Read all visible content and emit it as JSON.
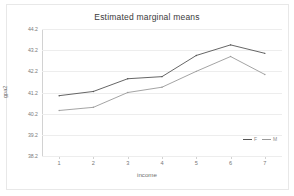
{
  "chart_data": {
    "type": "line",
    "title": "Estimated marginal means",
    "xlabel": "income",
    "ylabel": "gpa2",
    "categories": [
      "1",
      "2",
      "3",
      "4",
      "5",
      "6",
      "7"
    ],
    "x": [
      1,
      2,
      3,
      4,
      5,
      6,
      7
    ],
    "ytick_labels": [
      "44.2",
      "43.2",
      "42.2",
      "41.2",
      "40.2",
      "39.2",
      "38.2"
    ],
    "ytick_values": [
      44.2,
      43.2,
      42.2,
      41.2,
      40.2,
      39.2,
      38.2
    ],
    "ylim": [
      38.2,
      44.2
    ],
    "grid": true,
    "legend_position": "bottom-right",
    "series": [
      {
        "name": "F",
        "color": "#555555",
        "values": [
          41.05,
          41.25,
          41.85,
          41.95,
          42.95,
          43.45,
          43.05
        ]
      },
      {
        "name": "M",
        "color": "#9a9a9a",
        "values": [
          40.35,
          40.5,
          41.2,
          41.45,
          42.2,
          42.9,
          42.05
        ]
      }
    ],
    "annotations": []
  },
  "legend": {
    "title": "",
    "entries": [
      {
        "label": "F"
      },
      {
        "label": "M"
      }
    ]
  }
}
